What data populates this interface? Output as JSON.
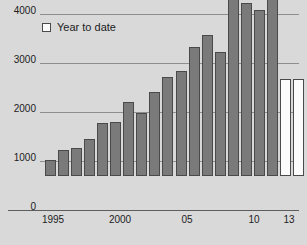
{
  "chart_data": {
    "type": "bar",
    "title": "",
    "subtitle": "",
    "xlabel": "",
    "ylabel": "",
    "ylim": [
      0,
      4000
    ],
    "yticks": [
      0,
      1000,
      2000,
      3000,
      4000
    ],
    "ytick_labels": [
      "0",
      "1000",
      "2000",
      "3000",
      "4000"
    ],
    "xticks": [
      1995,
      2000,
      2005,
      2010,
      2013
    ],
    "xtick_labels": [
      "1995",
      "2000",
      "05",
      "10",
      "13"
    ],
    "grid": "horizontal",
    "legend_position": "top-left",
    "legend": [
      {
        "label": "Year to date",
        "color": "#fbfbfb",
        "edge": "#4a4a4a"
      }
    ],
    "series": [
      {
        "name": "Full year",
        "color": "#7a7a7a",
        "edge": "#4a4a4a",
        "values": [
          330,
          530,
          580,
          750,
          1080,
          1110,
          1510,
          1290,
          1720,
          2020,
          2150,
          2630,
          2870,
          2530,
          3820,
          3530,
          3380,
          3800,
          null
        ]
      },
      {
        "name": "Year to date",
        "color": "#fbfbfb",
        "edge": "#4a4a4a",
        "values": [
          null,
          null,
          null,
          null,
          null,
          null,
          null,
          null,
          null,
          null,
          null,
          null,
          null,
          null,
          null,
          null,
          null,
          1970,
          1970
        ]
      }
    ],
    "categories": [
      "1995",
      "1996",
      "1997",
      "1998",
      "1999",
      "2000",
      "2001",
      "2002",
      "2003",
      "2004",
      "2005",
      "2006",
      "2007",
      "2008",
      "2009",
      "2010",
      "2011",
      "2012",
      "2013"
    ],
    "bars": [
      {
        "category": "1995",
        "value": 330,
        "kind": "full"
      },
      {
        "category": "1996",
        "value": 530,
        "kind": "full"
      },
      {
        "category": "1997",
        "value": 580,
        "kind": "full"
      },
      {
        "category": "1998",
        "value": 750,
        "kind": "full"
      },
      {
        "category": "1999",
        "value": 1080,
        "kind": "full"
      },
      {
        "category": "2000",
        "value": 1110,
        "kind": "full"
      },
      {
        "category": "2001",
        "value": 1510,
        "kind": "full"
      },
      {
        "category": "2002",
        "value": 1290,
        "kind": "full"
      },
      {
        "category": "2003",
        "value": 1720,
        "kind": "full"
      },
      {
        "category": "2004",
        "value": 2020,
        "kind": "full"
      },
      {
        "category": "2005",
        "value": 2150,
        "kind": "full"
      },
      {
        "category": "2006",
        "value": 2630,
        "kind": "full"
      },
      {
        "category": "2007",
        "value": 2870,
        "kind": "full"
      },
      {
        "category": "2008",
        "value": 2530,
        "kind": "full"
      },
      {
        "category": "2009",
        "value": 3820,
        "kind": "full"
      },
      {
        "category": "2010",
        "value": 3530,
        "kind": "full"
      },
      {
        "category": "2011",
        "value": 3380,
        "kind": "full"
      },
      {
        "category": "2012",
        "value": 3800,
        "kind": "full"
      },
      {
        "category": "2012",
        "value": 1970,
        "kind": "ytd"
      },
      {
        "category": "2013",
        "value": 1970,
        "kind": "ytd"
      }
    ],
    "colors": {
      "background": "#d9d9d9",
      "bar_fill": "#7a7a7a",
      "bar_edge": "#4a4a4a",
      "ytd_fill": "#fbfbfb",
      "gridline": "#8e8e8e",
      "axis": "#5d5d5d",
      "text": "#1c1c1c"
    }
  }
}
